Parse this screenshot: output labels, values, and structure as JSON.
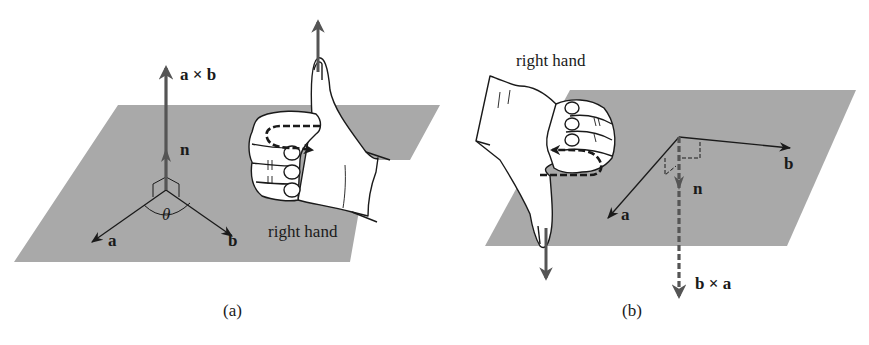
{
  "panels": [
    {
      "id": "a",
      "caption": "(a)",
      "labels": {
        "cross_product": "a × b",
        "normal": "n",
        "vector_a": "a",
        "vector_b": "b",
        "angle": "θ",
        "hand": "right hand"
      }
    },
    {
      "id": "b",
      "caption": "(b)",
      "labels": {
        "cross_product": "b × a",
        "normal": "n",
        "vector_a": "a",
        "vector_b": "b",
        "hand": "right hand"
      }
    }
  ],
  "colors": {
    "plane": "#a9a9a9",
    "vector_dark": "#555555",
    "line": "#1a1a1a",
    "hand_fill": "#ffffff"
  }
}
